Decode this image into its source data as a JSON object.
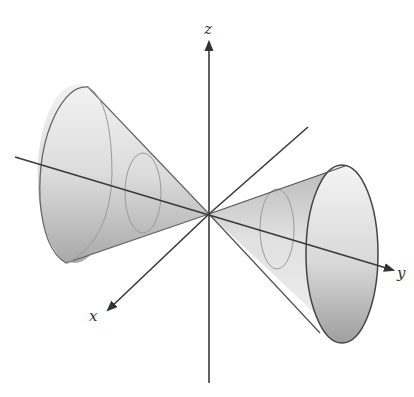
{
  "figure": {
    "axes": {
      "x": {
        "label": "x"
      },
      "y": {
        "label": "y"
      },
      "z": {
        "label": "z"
      }
    },
    "colors": {
      "axis": "#3a3a3a",
      "cone_light": "#eeeeee",
      "cone_mid": "#cfcfcf",
      "cone_dark": "#a8a8a8",
      "outline": "#555555",
      "cross_section": "#9a9a9a"
    }
  }
}
